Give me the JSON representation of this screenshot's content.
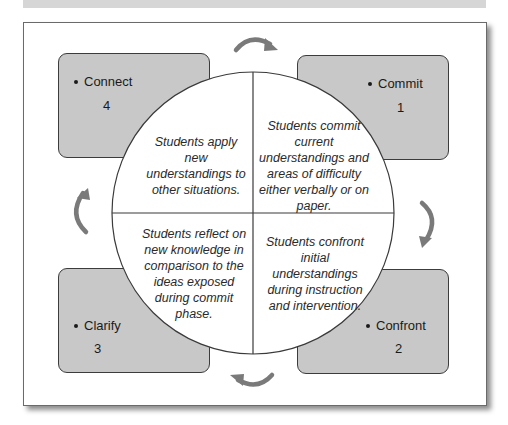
{
  "diagram": {
    "stages": [
      {
        "id": "connect",
        "label": "Connect",
        "number": "4",
        "description": "Students apply new understandings to other situations."
      },
      {
        "id": "commit",
        "label": "Commit",
        "number": "1",
        "description": "Students commit current understandings and areas of difficulty either verbally or on paper."
      },
      {
        "id": "clarify",
        "label": "Clarify",
        "number": "3",
        "description": "Students reflect on new knowledge in comparison to the ideas exposed during commit phase."
      },
      {
        "id": "confront",
        "label": "Confront",
        "number": "2",
        "description": "Students confront initial understandings during instruction and intervention."
      }
    ],
    "arrows": [
      "top-clockwise-arrow",
      "right-clockwise-arrow",
      "bottom-clockwise-arrow",
      "left-clockwise-arrow"
    ],
    "colors": {
      "box_fill": "#c8c8c8",
      "box_border": "#3c3c3c",
      "arrow": "#7a7a7a",
      "circle_fill": "#ffffff"
    }
  }
}
